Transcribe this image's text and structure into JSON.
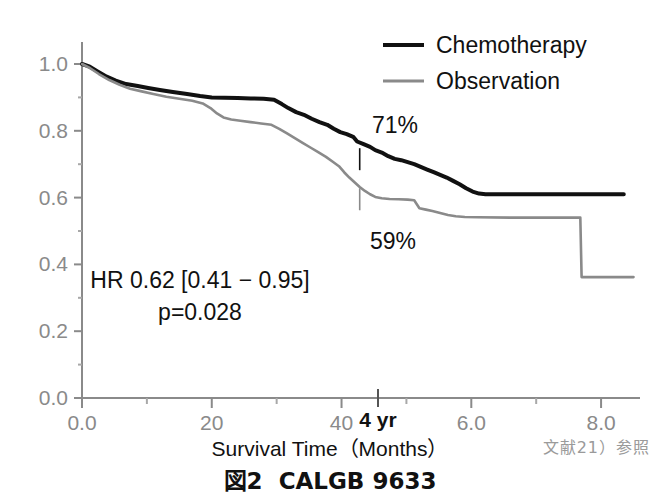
{
  "figure": {
    "caption_prefix": "図2",
    "caption_title": "CALGB 9633",
    "reference_note": "文献21）参照"
  },
  "legend": {
    "position": "top-right",
    "items": [
      {
        "label": "Chemotherapy",
        "color": "#111111",
        "width": 4
      },
      {
        "label": "Observation",
        "color": "#8a8a8a",
        "width": 3
      }
    ]
  },
  "annotations": {
    "chemo_pct": "71%",
    "obs_pct": "59%",
    "hr_line": "HR 0.62  [0.41 − 0.95]",
    "p_line": "p=0.028",
    "four_year": "4 yr"
  },
  "axes": {
    "x_title": "Survival Time（Months）",
    "x_ticks": [
      "0.0",
      "20",
      "40",
      "6.0",
      "8.0"
    ],
    "x_tick_values": [
      0.0,
      2.0,
      4.0,
      6.0,
      8.0
    ],
    "y_ticks": [
      "0.0",
      "0.2",
      "0.4",
      "0.6",
      "0.8",
      "1.0"
    ],
    "y_tick_values": [
      0.0,
      0.2,
      0.4,
      0.6,
      0.8,
      1.0
    ]
  },
  "chart_data": {
    "type": "line",
    "subtype": "kaplan-meier-survival",
    "xlabel": "Survival Time（Months）",
    "ylabel": "",
    "xlim": [
      0.0,
      8.6
    ],
    "ylim": [
      0.0,
      1.0
    ],
    "grid": false,
    "legend_position": "top-right",
    "x_ticks": [
      0.0,
      2.0,
      4.0,
      6.0,
      8.0
    ],
    "x_tick_labels": [
      "0.0",
      "20",
      "40",
      "6.0",
      "8.0"
    ],
    "y_ticks": [
      0.0,
      0.2,
      0.4,
      0.6,
      0.8,
      1.0
    ],
    "y_tick_labels": [
      "0.0",
      "0.2",
      "0.4",
      "0.6",
      "0.8",
      "1.0"
    ],
    "annotations": [
      {
        "text": "71%",
        "x": 4.6,
        "y": 0.82,
        "series": "Chemotherapy"
      },
      {
        "text": "59%",
        "x": 4.6,
        "y": 0.47,
        "series": "Observation"
      },
      {
        "text": "HR 0.62  [0.41 − 0.95]",
        "x": 2.1,
        "y": 0.335
      },
      {
        "text": "p=0.028",
        "x": 2.1,
        "y": 0.265
      },
      {
        "text": "4 yr",
        "x": 4.28,
        "y": -0.07,
        "marker": "axis-tick"
      }
    ],
    "marker_ticks": [
      {
        "series": "Chemotherapy",
        "x": 4.28,
        "y": 0.715
      },
      {
        "series": "Observation",
        "x": 4.28,
        "y": 0.595
      }
    ],
    "series": [
      {
        "name": "Chemotherapy",
        "color": "#111111",
        "final_value": 0.61,
        "value_at_4yr": 0.71,
        "points": [
          [
            0.0,
            1.0
          ],
          [
            0.12,
            0.992
          ],
          [
            0.24,
            0.978
          ],
          [
            0.38,
            0.962
          ],
          [
            0.52,
            0.95
          ],
          [
            0.68,
            0.94
          ],
          [
            0.86,
            0.934
          ],
          [
            1.02,
            0.928
          ],
          [
            1.2,
            0.922
          ],
          [
            1.4,
            0.916
          ],
          [
            1.62,
            0.91
          ],
          [
            1.82,
            0.904
          ],
          [
            2.0,
            0.9
          ],
          [
            2.2,
            0.899
          ],
          [
            2.4,
            0.898
          ],
          [
            2.6,
            0.897
          ],
          [
            2.8,
            0.896
          ],
          [
            2.96,
            0.893
          ],
          [
            3.08,
            0.88
          ],
          [
            3.18,
            0.868
          ],
          [
            3.3,
            0.856
          ],
          [
            3.42,
            0.848
          ],
          [
            3.54,
            0.836
          ],
          [
            3.66,
            0.826
          ],
          [
            3.78,
            0.818
          ],
          [
            3.88,
            0.806
          ],
          [
            3.98,
            0.796
          ],
          [
            4.08,
            0.79
          ],
          [
            4.18,
            0.782
          ],
          [
            4.24,
            0.768
          ],
          [
            4.34,
            0.76
          ],
          [
            4.44,
            0.752
          ],
          [
            4.52,
            0.742
          ],
          [
            4.62,
            0.735
          ],
          [
            4.72,
            0.724
          ],
          [
            4.82,
            0.716
          ],
          [
            4.92,
            0.712
          ],
          [
            5.02,
            0.706
          ],
          [
            5.12,
            0.7
          ],
          [
            5.22,
            0.692
          ],
          [
            5.32,
            0.684
          ],
          [
            5.42,
            0.676
          ],
          [
            5.52,
            0.668
          ],
          [
            5.62,
            0.66
          ],
          [
            5.72,
            0.65
          ],
          [
            5.82,
            0.64
          ],
          [
            5.92,
            0.628
          ],
          [
            6.02,
            0.618
          ],
          [
            6.12,
            0.612
          ],
          [
            6.22,
            0.61
          ],
          [
            7.0,
            0.61
          ],
          [
            8.0,
            0.61
          ],
          [
            8.35,
            0.61
          ]
        ]
      },
      {
        "name": "Observation",
        "color": "#8a8a8a",
        "final_value": 0.36,
        "value_at_4yr": 0.59,
        "points": [
          [
            0.0,
            1.0
          ],
          [
            0.12,
            0.988
          ],
          [
            0.26,
            0.97
          ],
          [
            0.42,
            0.952
          ],
          [
            0.58,
            0.938
          ],
          [
            0.74,
            0.926
          ],
          [
            0.92,
            0.918
          ],
          [
            1.1,
            0.91
          ],
          [
            1.3,
            0.902
          ],
          [
            1.5,
            0.896
          ],
          [
            1.7,
            0.89
          ],
          [
            1.86,
            0.882
          ],
          [
            1.98,
            0.868
          ],
          [
            2.08,
            0.852
          ],
          [
            2.18,
            0.84
          ],
          [
            2.3,
            0.834
          ],
          [
            2.44,
            0.83
          ],
          [
            2.6,
            0.826
          ],
          [
            2.76,
            0.822
          ],
          [
            2.92,
            0.818
          ],
          [
            3.04,
            0.806
          ],
          [
            3.16,
            0.792
          ],
          [
            3.28,
            0.778
          ],
          [
            3.4,
            0.764
          ],
          [
            3.52,
            0.75
          ],
          [
            3.64,
            0.736
          ],
          [
            3.76,
            0.722
          ],
          [
            3.86,
            0.708
          ],
          [
            3.96,
            0.694
          ],
          [
            4.04,
            0.676
          ],
          [
            4.12,
            0.66
          ],
          [
            4.2,
            0.646
          ],
          [
            4.28,
            0.632
          ],
          [
            4.36,
            0.62
          ],
          [
            4.44,
            0.61
          ],
          [
            4.52,
            0.602
          ],
          [
            4.62,
            0.598
          ],
          [
            4.74,
            0.596
          ],
          [
            4.88,
            0.595
          ],
          [
            5.02,
            0.594
          ],
          [
            5.12,
            0.592
          ],
          [
            5.2,
            0.568
          ],
          [
            5.3,
            0.564
          ],
          [
            5.4,
            0.56
          ],
          [
            5.52,
            0.554
          ],
          [
            5.64,
            0.548
          ],
          [
            5.76,
            0.544
          ],
          [
            5.9,
            0.542
          ],
          [
            6.1,
            0.541
          ],
          [
            6.6,
            0.54
          ],
          [
            7.2,
            0.54
          ],
          [
            7.68,
            0.54
          ],
          [
            7.7,
            0.362
          ],
          [
            8.0,
            0.362
          ],
          [
            8.5,
            0.362
          ]
        ]
      }
    ]
  }
}
